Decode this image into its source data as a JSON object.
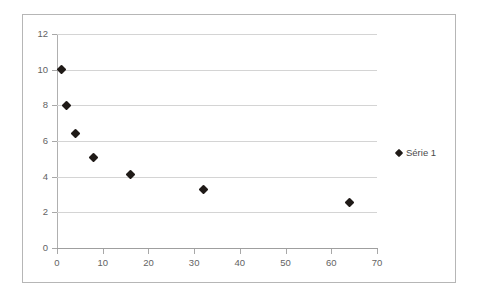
{
  "chart_data": {
    "type": "scatter",
    "title": "",
    "subtitle": "",
    "xlabel": "",
    "ylabel": "",
    "xlim": [
      0,
      70
    ],
    "ylim": [
      0,
      12
    ],
    "grid": "horizontal",
    "legend_position": "right",
    "x_ticks": [
      0,
      10,
      20,
      30,
      40,
      50,
      60,
      70
    ],
    "y_ticks": [
      0,
      2,
      4,
      6,
      8,
      10,
      12
    ],
    "x_tick_labels": [
      "0",
      "10",
      "20",
      "30",
      "40",
      "50",
      "60",
      "70"
    ],
    "y_tick_labels": [
      "0",
      "2",
      "4",
      "6",
      "8",
      "10",
      "12"
    ],
    "series": [
      {
        "name": "Série 1",
        "marker": "diamond",
        "color": "#1f1a17",
        "points": [
          {
            "x": 1,
            "y": 10
          },
          {
            "x": 2,
            "y": 8
          },
          {
            "x": 4,
            "y": 6.4
          },
          {
            "x": 8,
            "y": 5.1
          },
          {
            "x": 16,
            "y": 4.1
          },
          {
            "x": 32,
            "y": 3.3
          },
          {
            "x": 64,
            "y": 2.55
          }
        ]
      }
    ]
  },
  "legend": {
    "entries": [
      {
        "label": "Série 1",
        "marker": "diamond-marker-icon",
        "color": "#1f1a17"
      }
    ]
  },
  "colors": {
    "frame_border": "#b6b6b6",
    "gridline": "#d4d4d4",
    "axis": "#a8a8a8",
    "tick_label": "#636363",
    "marker": "#1f1a17",
    "background": "#ffffff"
  }
}
